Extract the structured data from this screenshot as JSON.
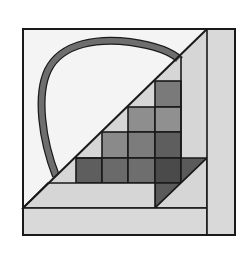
{
  "figure": {
    "colors": {
      "background": "#ffffff",
      "sky": "#f4f4f4",
      "light": "#d6d6d6",
      "border_strip": "#d9d9d9",
      "handle": "#6e6e6e",
      "cell_1": "#6a6a6a",
      "cell_2": "#8a8a8a",
      "cell_3": "#9a9a9a",
      "cell_4": "#5a5a5a",
      "outline": "#1a1a1a"
    }
  }
}
